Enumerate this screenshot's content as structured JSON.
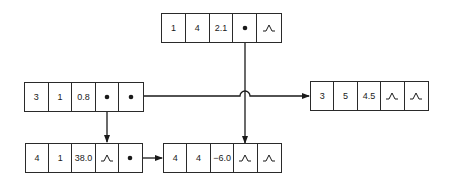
{
  "nodes": [
    {
      "id": "top",
      "cells": [
        "1",
        "4",
        "2.1",
        "ptr",
        "nil"
      ]
    },
    {
      "id": "left",
      "cells": [
        "3",
        "1",
        "0.8",
        "ptr",
        "ptr"
      ]
    },
    {
      "id": "right",
      "cells": [
        "3",
        "5",
        "4.5",
        "nil",
        "nil"
      ]
    },
    {
      "id": "bottom_left",
      "cells": [
        "4",
        "1",
        "38.0",
        "nil",
        "ptr"
      ]
    },
    {
      "id": "bottom_mid",
      "cells": [
        "4",
        "4",
        "−6.0",
        "nil",
        "nil"
      ]
    }
  ],
  "legend": {
    "ptr": "pointer-dot",
    "nil": "null-glyph"
  },
  "colors": {
    "line": "#1a1a1a",
    "border": "#2a2a2a",
    "background": "#ffffff"
  }
}
